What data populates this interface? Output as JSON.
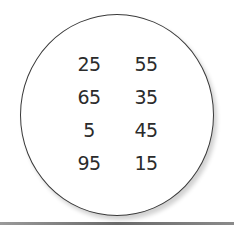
{
  "numbers": {
    "left": [
      "25",
      "65",
      "5",
      "95"
    ],
    "right": [
      "55",
      "35",
      "45",
      "15"
    ]
  },
  "colors": {
    "stroke": "#3a3a3a",
    "text": "#2b2b2b"
  }
}
